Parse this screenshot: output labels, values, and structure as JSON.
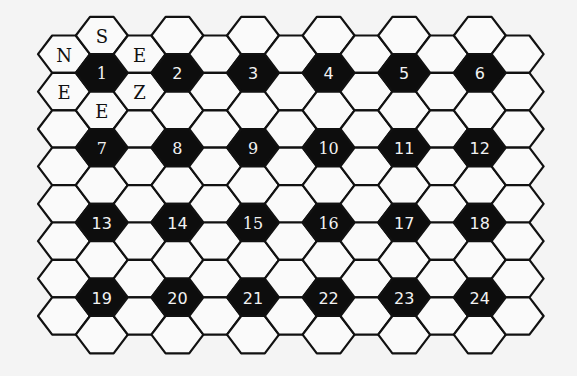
{
  "puzzle": {
    "grid": {
      "columns": 13,
      "long_column_rows": 9,
      "short_column_rows": 8,
      "origin_x": 64,
      "col_spacing": 37.8,
      "long_col_origin_y": 35.5,
      "short_col_origin_y": 54.2,
      "row_spacing": 37.4,
      "hex_half_width": 26,
      "hex_half_edge": 11.8,
      "hex_half_height": 18.7
    },
    "colors": {
      "background": "#f4f4f4",
      "cell": "#fafafa",
      "numbered_cell": "#0d0d0d",
      "outline": "#111111",
      "number_text": "#f2f2f2",
      "letter_text": "#111111"
    },
    "numbered_cells": [
      {
        "label": "1",
        "col": 1,
        "row": 1,
        "serif": true
      },
      {
        "label": "2",
        "col": 3,
        "row": 1
      },
      {
        "label": "3",
        "col": 5,
        "row": 1
      },
      {
        "label": "4",
        "col": 7,
        "row": 1
      },
      {
        "label": "5",
        "col": 9,
        "row": 1
      },
      {
        "label": "6",
        "col": 11,
        "row": 1
      },
      {
        "label": "7",
        "col": 1,
        "row": 3,
        "serif": true
      },
      {
        "label": "8",
        "col": 3,
        "row": 3,
        "serif": true
      },
      {
        "label": "9",
        "col": 5,
        "row": 3,
        "serif": true
      },
      {
        "label": "10",
        "col": 7,
        "row": 3,
        "serif": true
      },
      {
        "label": "11",
        "col": 9,
        "row": 3
      },
      {
        "label": "12",
        "col": 11,
        "row": 3
      },
      {
        "label": "13",
        "col": 1,
        "row": 5
      },
      {
        "label": "14",
        "col": 3,
        "row": 5
      },
      {
        "label": "15",
        "col": 5,
        "row": 5,
        "serif": true
      },
      {
        "label": "16",
        "col": 7,
        "row": 5,
        "serif": true
      },
      {
        "label": "17",
        "col": 9,
        "row": 5
      },
      {
        "label": "18",
        "col": 11,
        "row": 5
      },
      {
        "label": "19",
        "col": 1,
        "row": 7
      },
      {
        "label": "20",
        "col": 3,
        "row": 7
      },
      {
        "label": "21",
        "col": 5,
        "row": 7
      },
      {
        "label": "22",
        "col": 7,
        "row": 7
      },
      {
        "label": "23",
        "col": 9,
        "row": 7
      },
      {
        "label": "24",
        "col": 11,
        "row": 7
      }
    ],
    "letter_cells": [
      {
        "letter": "N",
        "col": 0,
        "row": 0
      },
      {
        "letter": "S",
        "col": 1,
        "row": 0
      },
      {
        "letter": "E",
        "col": 2,
        "row": 0
      },
      {
        "letter": "E",
        "col": 0,
        "row": 1
      },
      {
        "letter": "Z",
        "col": 2,
        "row": 1
      },
      {
        "letter": "E",
        "col": 1,
        "row": 2
      }
    ]
  }
}
